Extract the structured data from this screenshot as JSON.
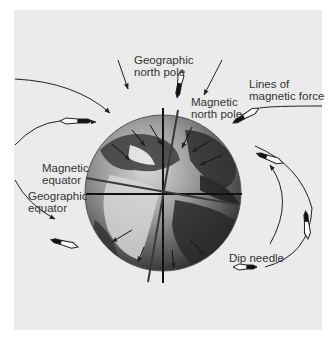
{
  "diagram": {
    "labels": {
      "geographic_north_pole": "Geographic\nnorth pole",
      "magnetic_north_pole": "Magnetic\nnorth pole",
      "lines_of_magnetic_force": "Lines of\nmagnetic force",
      "magnetic_equator": "Magnetic\nequator",
      "geographic_equator": "Geographic\nequator",
      "dip_needle": "Dip needle"
    },
    "colors": {
      "background": "#ebebeb",
      "line": "#222222",
      "geographic_axis": "#111111",
      "magnetic_axis": "#3a3a3a",
      "label_text": "#333333"
    }
  }
}
